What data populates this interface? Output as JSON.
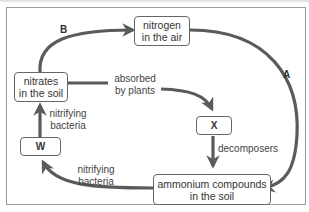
{
  "diagram": {
    "nodes": {
      "nitrogen_air": "nitrogen\nin the air",
      "nitrates_soil": "nitrates\nin the soil",
      "x": "X",
      "w": "W",
      "ammonium": "ammonium compounds\nin the soil"
    },
    "labels": {
      "absorbed": "absorbed\nby plants",
      "decomposers": "decomposers",
      "nitrifying_upper": "nitrifying\nbacteria",
      "nitrifying_lower": "nitrifying\nbacteria",
      "arrow_a": "A",
      "arrow_b": "B"
    },
    "edges": [
      {
        "from": "nitrates_soil",
        "to": "nitrogen_air",
        "label": "B"
      },
      {
        "from": "nitrogen_air",
        "to": "ammonium",
        "label": "A"
      },
      {
        "from": "nitrates_soil",
        "to": "x",
        "label": "absorbed by plants"
      },
      {
        "from": "x",
        "to": "ammonium",
        "label": "decomposers"
      },
      {
        "from": "ammonium",
        "to": "w",
        "label": "nitrifying bacteria"
      },
      {
        "from": "w",
        "to": "nitrates_soil",
        "label": "nitrifying bacteria"
      }
    ],
    "colors": {
      "arrow": "#5a5a5a",
      "box_border": "#666666",
      "frame": "#9a9a9a"
    }
  }
}
